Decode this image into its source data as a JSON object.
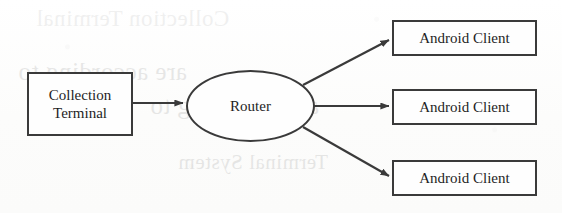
{
  "figure": {
    "type": "network-architecture-diagram",
    "width": 562,
    "height": 213,
    "background_color": "#fdfdfd",
    "stroke_color": "#3a3a3a",
    "text_color": "#1e1e1e"
  },
  "nodes": {
    "collection_terminal": {
      "label": "Collection Terminal",
      "label_line_1": "Collection",
      "label_line_2": "Terminal",
      "shape": "rectangle"
    },
    "router": {
      "label": "Router",
      "shape": "ellipse"
    },
    "android_clients": [
      {
        "label": "Android Client",
        "shape": "rectangle"
      },
      {
        "label": "Android Client",
        "shape": "rectangle"
      },
      {
        "label": "Android Client",
        "shape": "rectangle"
      }
    ]
  },
  "connectors": [
    {
      "from": "collection_terminal",
      "to": "router",
      "style": "arrow"
    },
    {
      "from": "router",
      "to": "android_client_1",
      "style": "arrow"
    },
    {
      "from": "router",
      "to": "android_client_2",
      "style": "arrow"
    },
    {
      "from": "router",
      "to": "android_client_3",
      "style": "arrow"
    }
  ],
  "scan_bleedthrough": {
    "note": "faint mirrored show-through text from the reverse side of the scanned page",
    "line_1": "are according to",
    "line_2": "are according to",
    "line_3": "Terminal System",
    "line_4": "Collection Terminal"
  }
}
